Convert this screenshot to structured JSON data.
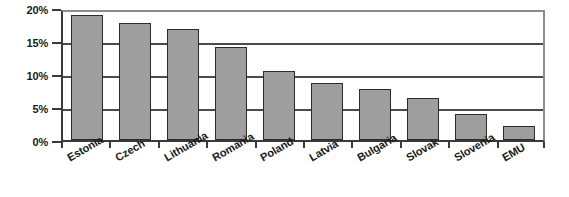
{
  "chart_data": {
    "type": "bar",
    "title": "",
    "subtitle": "",
    "xlabel": "",
    "ylabel": "",
    "categories": [
      "Estonia",
      "Czech",
      "Lithuania",
      "Romania",
      "Poland",
      "Latvia",
      "Bulgaria",
      "Slovak",
      "Slovenia",
      "EMU"
    ],
    "values": [
      19.3,
      18.0,
      17.1,
      14.3,
      10.6,
      8.8,
      7.8,
      6.4,
      4.0,
      2.2
    ],
    "ylim": [
      0,
      20
    ],
    "yticks": [
      0,
      5,
      10,
      15,
      20
    ],
    "ytick_labels": [
      "0%",
      "5%",
      "10%",
      "15%",
      "20%"
    ],
    "grid": true,
    "grid_axis": "y",
    "legend": false,
    "legend_position": "none",
    "bar_color": "#9e9e9e",
    "bar_edge_color": "#2c2c2c",
    "axis_color": "#3a3a3a",
    "grid_color": "#4a4a4a",
    "background_color": "#ffffff",
    "tick_label_rotation": -30,
    "annotations": []
  }
}
